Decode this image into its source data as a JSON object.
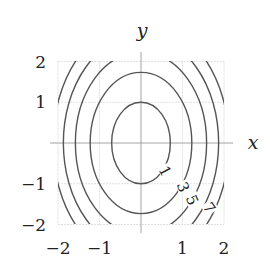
{
  "chart_data": {
    "type": "contour",
    "title": "",
    "function": "f(x,y) = 2x^2 + y^2",
    "xlabel": "x",
    "ylabel": "y",
    "xlim": [
      -2,
      2
    ],
    "ylim": [
      -2,
      2
    ],
    "grid": true,
    "x_ticks": [
      -2,
      -1,
      1,
      2
    ],
    "y_ticks": [
      -2,
      -1,
      1,
      2
    ],
    "x_tick_labels": [
      "−2",
      "−1",
      "1",
      "2"
    ],
    "y_tick_labels": [
      "−2",
      "−1",
      "1",
      "2"
    ],
    "levels": [
      1,
      3,
      5,
      7,
      9
    ],
    "contour_labels": [
      "1",
      "3",
      "5",
      "7"
    ],
    "line_color": "#555555",
    "grid_color": "#d8d8d8",
    "axis_color": "#999999"
  }
}
